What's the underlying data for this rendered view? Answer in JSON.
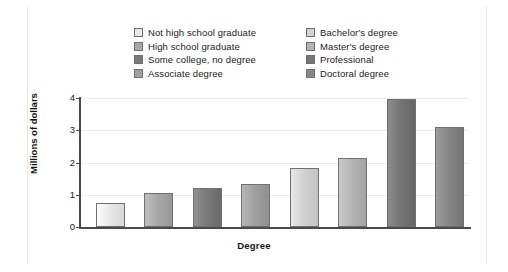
{
  "chart_data": {
    "type": "bar",
    "title": "",
    "xlabel": "Degree",
    "ylabel": "Millions of dollars",
    "ylim": [
      0,
      4
    ],
    "yticks": [
      "0",
      "1",
      "2",
      "3",
      "4"
    ],
    "grid": true,
    "legend_position": "top",
    "categories": [
      "Not high school graduate",
      "High school graduate",
      "Some college, no degree",
      "Associate degree",
      "Bachelor's degree",
      "Master's degree",
      "Professional",
      "Doctoral degree"
    ],
    "values": [
      0.75,
      1.05,
      1.2,
      1.32,
      1.82,
      2.15,
      3.98,
      3.1
    ],
    "colors": [
      "#e8e8e8",
      "#a8a8a8",
      "#7a7a7a",
      "#a0a0a0",
      "#d2d2d2",
      "#b4b4b4",
      "#767676",
      "#868686"
    ]
  },
  "legend": {
    "column_a": [
      {
        "label": "Not high school graduate",
        "swatch": "#e8e8e8"
      },
      {
        "label": "High school graduate",
        "swatch": "#a8a8a8"
      },
      {
        "label": "Some college, no degree",
        "swatch": "#7a7a7a"
      },
      {
        "label": "Associate degree",
        "swatch": "#a0a0a0"
      }
    ],
    "column_b": [
      {
        "label": "Bachelor's degree",
        "swatch": "#d2d2d2"
      },
      {
        "label": "Master's degree",
        "swatch": "#b4b4b4"
      },
      {
        "label": "Professional",
        "swatch": "#767676"
      },
      {
        "label": "Doctoral degree",
        "swatch": "#868686"
      }
    ]
  },
  "axes": {
    "y_title": "Millions of dollars",
    "x_title": "Degree",
    "y_ticks": [
      "4",
      "3",
      "2",
      "1",
      "0"
    ]
  }
}
